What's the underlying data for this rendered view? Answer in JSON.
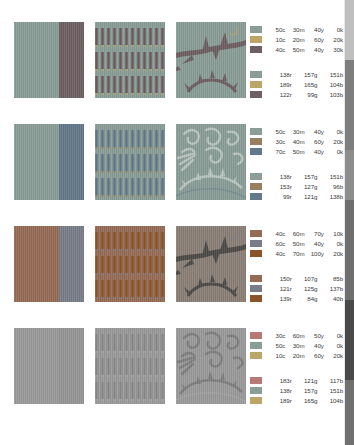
{
  "page": {
    "background_color": "#ffffff",
    "swatch_rows": [
      {
        "id": "row-1",
        "panels": [
          {
            "name": "flat-color-split-panel",
            "type": "split",
            "colors": [
              "#8a9d97",
              "#6e5f62"
            ]
          },
          {
            "name": "vertical-bar-pattern-panel",
            "type": "bars",
            "base_color": "#8a9d97",
            "bar_color": "#6e5f62",
            "accent_color": "#bda568",
            "bands": 3
          },
          {
            "name": "thorn-branch-artwork-panel",
            "type": "artwork",
            "motif": "thorn-branch",
            "base_color": "#8a9d97",
            "ink_color": "#6e5f62",
            "accent_color": "#bda568"
          }
        ],
        "cmyk": {
          "label": "cmyk-legend",
          "entries": [
            {
              "swatch": "#8a9d97",
              "c": "50c",
              "m": "30m",
              "y": "40y",
              "k": "0k"
            },
            {
              "swatch": "#bda568",
              "c": "10c",
              "m": "20m",
              "y": "60y",
              "k": "20k"
            },
            {
              "swatch": "#6e5f62",
              "c": "40c",
              "m": "50m",
              "y": "40y",
              "k": "30k"
            }
          ]
        },
        "rgb": {
          "label": "rgb-legend",
          "entries": [
            {
              "swatch": "#8a9d97",
              "r": "138r",
              "g": "157g",
              "b": "151b"
            },
            {
              "swatch": "#bda568",
              "r": "189r",
              "g": "165g",
              "b": "104b"
            },
            {
              "swatch": "#6e5f62",
              "r": "122r",
              "g": "99g",
              "b": "103b"
            }
          ]
        }
      },
      {
        "id": "row-2",
        "panels": [
          {
            "name": "flat-color-split-panel",
            "type": "split",
            "colors": [
              "#8a9d97",
              "#63798a"
            ]
          },
          {
            "name": "vertical-bar-pattern-panel",
            "type": "bars",
            "base_color": "#8a9d97",
            "bar_color": "#63798a",
            "accent_color": "#997f60",
            "bands": 3
          },
          {
            "name": "flourish-artwork-panel",
            "type": "artwork",
            "motif": "flourish-scrolls",
            "base_color": "#8a9d97",
            "ink_color": "#b9c4bf",
            "accent_color": "#63798a"
          }
        ],
        "cmyk": {
          "label": "cmyk-legend",
          "entries": [
            {
              "swatch": "#8a9d97",
              "c": "50c",
              "m": "30m",
              "y": "40y",
              "k": "0k"
            },
            {
              "swatch": "#997f60",
              "c": "30c",
              "m": "40m",
              "y": "60y",
              "k": "20k"
            },
            {
              "swatch": "#63798a",
              "c": "70c",
              "m": "50m",
              "y": "40y",
              "k": "0k"
            }
          ]
        },
        "rgb": {
          "label": "rgb-legend",
          "entries": [
            {
              "swatch": "#8a9d97",
              "r": "138r",
              "g": "157g",
              "b": "151b"
            },
            {
              "swatch": "#997f60",
              "r": "153r",
              "g": "127g",
              "b": "96b"
            },
            {
              "swatch": "#63798a",
              "r": "99r",
              "g": "121g",
              "b": "138b"
            }
          ]
        }
      },
      {
        "id": "row-3",
        "panels": [
          {
            "name": "flat-color-split-panel",
            "type": "split",
            "colors": [
              "#966b55",
              "#797d89"
            ]
          },
          {
            "name": "vertical-bar-pattern-panel",
            "type": "bars",
            "base_color": "#966b55",
            "bar_color": "#8b5428",
            "accent_color": "#797d89",
            "bands": 3
          },
          {
            "name": "thorn-branch-artwork-panel",
            "type": "artwork",
            "motif": "thorn-branch",
            "base_color": "#8b7f76",
            "ink_color": "#4d4a48",
            "accent_color": "#797d89"
          }
        ],
        "cmyk": {
          "label": "cmyk-legend",
          "entries": [
            {
              "swatch": "#966b55",
              "c": "40c",
              "m": "60m",
              "y": "70y",
              "k": "10k"
            },
            {
              "swatch": "#797d89",
              "c": "60c",
              "m": "50m",
              "y": "40y",
              "k": "0k"
            },
            {
              "swatch": "#8b5428",
              "c": "40c",
              "m": "70m",
              "y": "100y",
              "k": "20k"
            }
          ]
        },
        "rgb": {
          "label": "rgb-legend",
          "entries": [
            {
              "swatch": "#966b55",
              "r": "150r",
              "g": "107g",
              "b": "85b"
            },
            {
              "swatch": "#797d89",
              "r": "121r",
              "g": "125g",
              "b": "137b"
            },
            {
              "swatch": "#8b5428",
              "r": "139r",
              "g": "84g",
              "b": "40b"
            }
          ]
        }
      },
      {
        "id": "row-4",
        "panels": [
          {
            "name": "flat-color-split-panel",
            "type": "split",
            "colors": [
              "#9a9a9a",
              "#969696"
            ]
          },
          {
            "name": "vertical-bar-pattern-panel",
            "type": "bars",
            "base_color": "#9a9a9a",
            "bar_color": "#8b8b8b",
            "accent_color": "#a8a8a8",
            "bands": 3
          },
          {
            "name": "flourish-artwork-panel",
            "type": "artwork",
            "motif": "flourish-scrolls",
            "base_color": "#9a9a9a",
            "ink_color": "#7e7e7e",
            "accent_color": "#b0b0b0"
          }
        ],
        "cmyk": {
          "label": "cmyk-legend",
          "entries": [
            {
              "swatch": "#b77975",
              "c": "30c",
              "m": "60m",
              "y": "50y",
              "k": "0k"
            },
            {
              "swatch": "#8a9d97",
              "c": "50c",
              "m": "30m",
              "y": "40y",
              "k": "0k"
            },
            {
              "swatch": "#bda568",
              "c": "10c",
              "m": "20m",
              "y": "60y",
              "k": "20k"
            }
          ]
        },
        "rgb": {
          "label": "rgb-legend",
          "entries": [
            {
              "swatch": "#b77975",
              "r": "183r",
              "g": "121g",
              "b": "117b"
            },
            {
              "swatch": "#8a9d97",
              "r": "138r",
              "g": "157g",
              "b": "151b"
            },
            {
              "swatch": "#bda568",
              "r": "189r",
              "g": "165g",
              "b": "104b"
            }
          ]
        }
      }
    ]
  }
}
